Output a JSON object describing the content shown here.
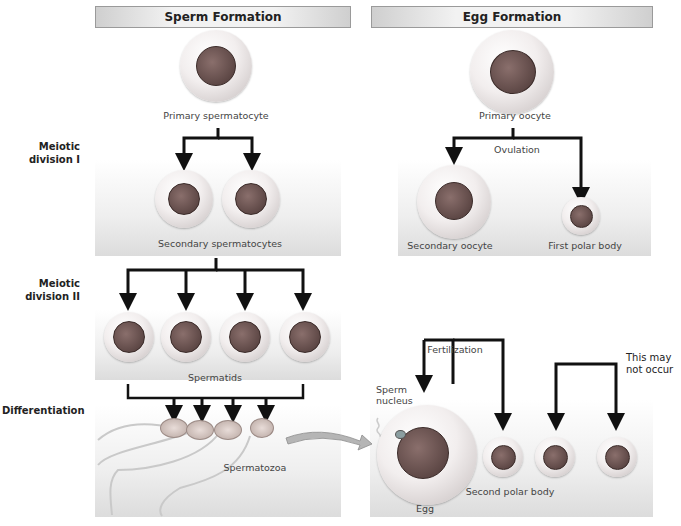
{
  "headers": {
    "sperm": "Sperm Formation",
    "egg": "Egg Formation"
  },
  "stages": {
    "meiosis1": [
      "Meiotic",
      "division I"
    ],
    "meiosis2": [
      "Meiotic",
      "division II"
    ],
    "differentiation": "Differentiation"
  },
  "sperm_labels": {
    "primary": "Primary spermatocyte",
    "secondary": "Secondary spermatocytes",
    "spermatids": "Spermatids",
    "spermatozoa": "Spermatozoa"
  },
  "egg_labels": {
    "primary": "Primary oocyte",
    "ovulation": "Ovulation",
    "secondary": "Secondary oocyte",
    "first_polar": "First polar body",
    "fertilization": "Fertilization",
    "sperm_nucleus": [
      "Sperm",
      "nucleus"
    ],
    "egg": "Egg",
    "second_polar": "Second polar body",
    "may_not_occur": [
      "This may",
      "not occur"
    ]
  },
  "colors": {
    "arrow": "#111111",
    "nucleus": "#5e4846",
    "panel_bottom": "#dcdcdc",
    "transfer_arrow": "#b5b5b5"
  }
}
